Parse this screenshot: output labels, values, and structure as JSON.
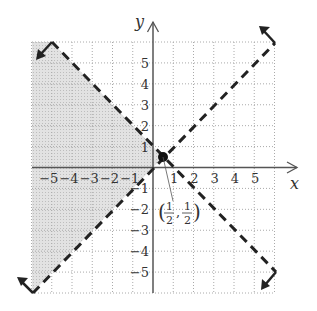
{
  "chart_data": {
    "type": "line",
    "title": "",
    "xlabel": "x",
    "ylabel": "y",
    "xlim": [
      -6,
      6
    ],
    "ylim": [
      -6,
      6
    ],
    "grid": true,
    "grid_style": "dotted",
    "x_ticks": [
      "-5",
      "-4",
      "-3",
      "-2",
      "-1",
      "1",
      "2",
      "3",
      "4",
      "5"
    ],
    "y_ticks": [
      "5",
      "4",
      "3",
      "2",
      "1",
      "-1",
      "-2",
      "-3",
      "-4",
      "-5"
    ],
    "series": [
      {
        "name": "y = -x + 1",
        "style": "dashed",
        "points": [
          [
            -5,
            6
          ],
          [
            6,
            -5
          ]
        ]
      },
      {
        "name": "y = x",
        "style": "dashed",
        "points": [
          [
            -6,
            -6
          ],
          [
            6,
            6
          ]
        ]
      }
    ],
    "shaded_region": {
      "description": "region where y > x and y < -x + 1 (left of intersection)",
      "vertices": [
        [
          -6,
          -6
        ],
        [
          -6,
          6
        ],
        [
          -5,
          6
        ],
        [
          0.5,
          0.5
        ]
      ],
      "color": "#d9d9d9"
    },
    "annotations": [
      {
        "text": "(1/2, 1/2)",
        "point": [
          0.5,
          0.5
        ],
        "marker": "filled-circle"
      }
    ]
  },
  "labels": {
    "x_axis": "x",
    "y_axis": "y",
    "point_label_x_num": "1",
    "point_label_x_den": "2",
    "point_label_y_num": "1",
    "point_label_y_den": "2",
    "open_paren": "(",
    "close_paren": ")",
    "comma": ","
  }
}
